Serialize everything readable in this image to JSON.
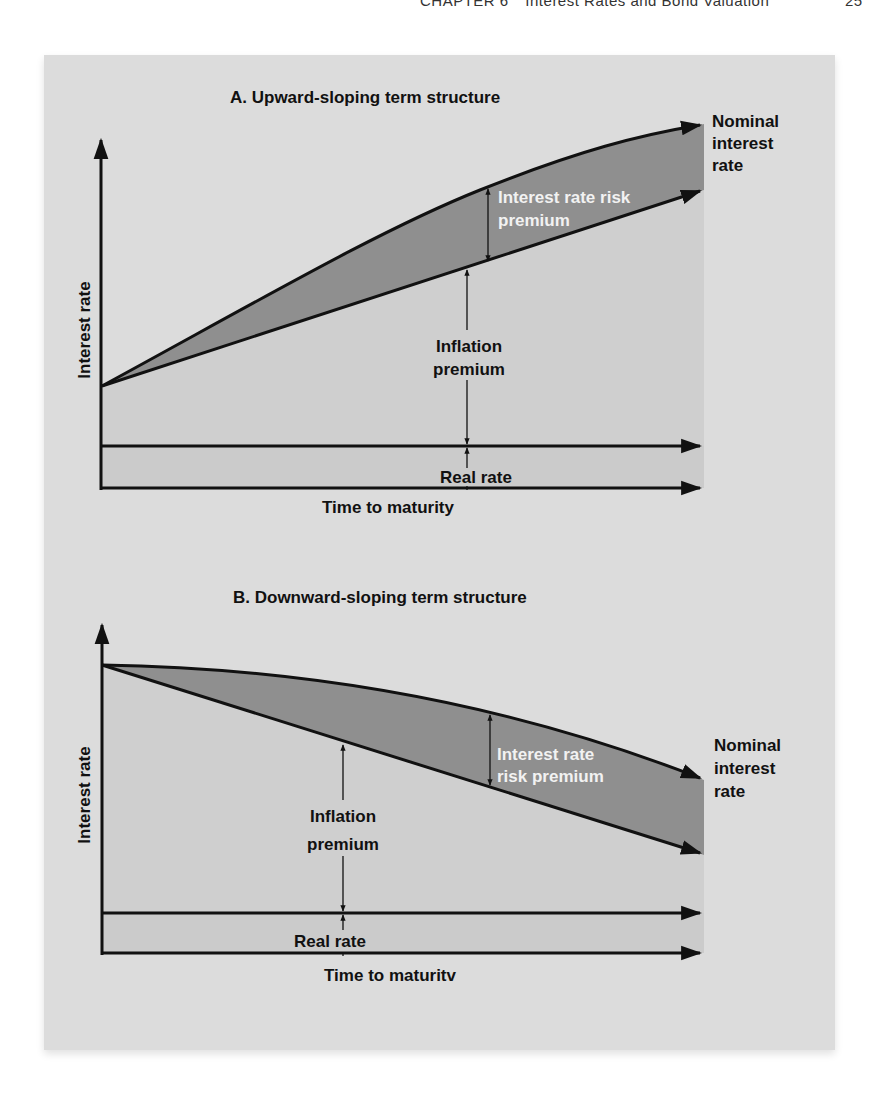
{
  "running_head": {
    "chapter": "CHAPTER 6",
    "title": "Interest Rates and Bond Valuation",
    "page": "25"
  },
  "colors": {
    "panel_bg": "#dcdcdc",
    "inflation_region": "#cfcfcf",
    "real_rate_band": "#cbcbcb",
    "risk_premium_band": "#8f8f8f",
    "line": "#111111"
  },
  "panel_a": {
    "title": "A. Upward-sloping term structure",
    "y_axis_label": "Interest rate",
    "x_axis_label": "Time to maturity",
    "nominal_label": [
      "Nominal",
      "interest",
      "rate"
    ],
    "risk_premium_label": [
      "Interest rate risk",
      "premium"
    ],
    "inflation_label": [
      "Inflation",
      "premium"
    ],
    "real_rate_label": "Real rate"
  },
  "panel_b": {
    "title": "B. Downward-sloping term structure",
    "y_axis_label": "Interest rate",
    "x_axis_label": "Time to maturitv",
    "nominal_label": [
      "Nominal",
      "interest",
      "rate"
    ],
    "risk_premium_label": [
      "Interest rate",
      "risk premium"
    ],
    "inflation_label": [
      "Inflation",
      "premium"
    ],
    "real_rate_label": "Real rate"
  }
}
